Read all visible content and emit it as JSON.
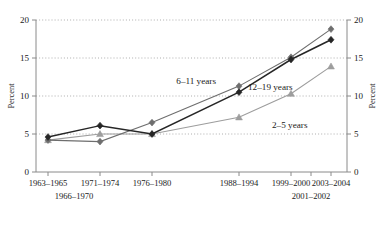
{
  "chart_data": {
    "type": "line",
    "title": "",
    "xlabel": "",
    "ylabel": "Percent",
    "ylabel_right": "Percent",
    "ylim": [
      0,
      20
    ],
    "yticks": [
      0,
      5,
      10,
      15,
      20
    ],
    "yticklabels": [
      "0",
      "5",
      "10",
      "15",
      "20"
    ],
    "yticklabels_right": [
      "0",
      "5",
      "10",
      "15",
      "20"
    ],
    "grid": true,
    "grid_axis": "y",
    "legend_position": "inline-annotations",
    "categories": [
      "1963–1965",
      "1966–1970",
      "1971–1974",
      "1976–1980",
      "1988–1994",
      "1999–2000",
      "2001–2002",
      "2003–2004"
    ],
    "xtick_labels_row1": [
      "1963–1965",
      "1971–1974",
      "1976–1980",
      "1988–1994",
      "1999–2000",
      "2003–2004"
    ],
    "xtick_labels_row2": [
      "1966–1970",
      "2001–2002"
    ],
    "series": [
      {
        "name": "2–5 years",
        "label": "2–5 years",
        "marker": "triangle",
        "color": "#9d9d9d",
        "x": [
          "1966–1970",
          "1971–1974",
          "1976–1980",
          "1988–1994",
          "1999–2000",
          "2003–2004"
        ],
        "values": [
          4.2,
          5.0,
          5.0,
          7.2,
          10.3,
          13.9
        ]
      },
      {
        "name": "6–11 years",
        "label": "6–11 years",
        "marker": "diamond",
        "color": "#6e6e6e",
        "x": [
          "1963–1965",
          "1971–1974",
          "1976–1980",
          "1988–1994",
          "1999–2000",
          "2003–2004"
        ],
        "values": [
          4.2,
          4.0,
          6.5,
          11.3,
          15.1,
          18.8
        ]
      },
      {
        "name": "12–19 years",
        "label": "12–19 years",
        "marker": "diamond",
        "color": "#262626",
        "x": [
          "1966–1970",
          "1971–1974",
          "1976–1980",
          "1988–1994",
          "1999–2000",
          "2003–2004"
        ],
        "values": [
          4.6,
          6.1,
          5.0,
          10.5,
          14.8,
          17.4
        ]
      }
    ],
    "annotations": [
      {
        "text": "6–11 years",
        "series": "6–11 years"
      },
      {
        "text": "12–19 years",
        "series": "12–19 years"
      },
      {
        "text": "2–5 years",
        "series": "2–5 years"
      }
    ]
  }
}
